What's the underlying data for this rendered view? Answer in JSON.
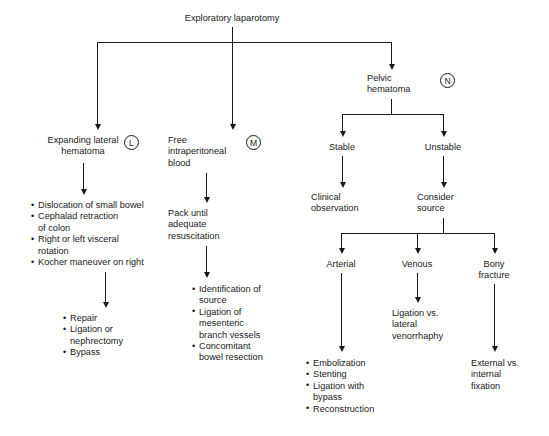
{
  "diagram": {
    "title": "Exploratory laparotomy",
    "branches": {
      "left": {
        "label": "Expanding lateral\nhematoma",
        "marker": "L",
        "steps": [
          "Dislocation of small bowel",
          "Cephalad retraction\nof colon",
          "Right or left visceral\nrotation",
          "Kocher maneuver on right"
        ],
        "outcomes": [
          "Repair",
          "Ligation or\nnephrectomy",
          "Bypass"
        ]
      },
      "middle": {
        "label": "Free\nintraperitoneal\nblood",
        "marker": "M",
        "step": "Pack until\nadequate\nresuscitation",
        "outcomes": [
          "Identification of\nsource",
          "Ligation of\nmesenteric\nbranch vessels",
          "Concomitant\nbowel resection"
        ]
      },
      "right": {
        "label": "Pelvic\nhematoma",
        "marker": "N",
        "stable": {
          "label": "Stable",
          "action": "Clinical\nobservation"
        },
        "unstable": {
          "label": "Unstable",
          "action": "Consider\nsource",
          "sources": {
            "arterial": {
              "label": "Arterial",
              "outcomes": [
                "Embolization",
                "Stenting",
                "Ligation with\nbypass",
                "Reconstruction"
              ]
            },
            "venous": {
              "label": "Venous",
              "action": "Ligation vs.\nlateral\nvenorrhaphy"
            },
            "bony": {
              "label": "Bony\nfracture",
              "action": "External vs.\ninternal\nfixation"
            }
          }
        }
      }
    }
  }
}
